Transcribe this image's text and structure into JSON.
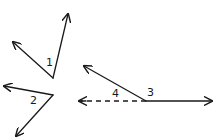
{
  "diagram": {
    "type": "angle-figures",
    "stroke_color": "#1a1a1a",
    "background": "#ffffff",
    "figures": [
      {
        "id": "angle-1",
        "label": "1",
        "vertex": [
          53,
          78
        ],
        "rays": [
          [
            68,
            14
          ],
          [
            13,
            42
          ]
        ],
        "label_pos": [
          46,
          66
        ]
      },
      {
        "id": "angle-2",
        "label": "2",
        "vertex": [
          53,
          95
        ],
        "rays": [
          [
            4,
            86
          ],
          [
            16,
            136
          ]
        ],
        "label_pos": [
          30,
          104
        ]
      },
      {
        "id": "angles-3-4",
        "labels": [
          "4",
          "3"
        ],
        "vertex": [
          146,
          101
        ],
        "rays": [
          [
            84,
            66
          ],
          [
            212,
            101
          ]
        ],
        "dashed_ray": [
          79,
          101
        ],
        "label_pos_4": [
          112,
          97
        ],
        "label_pos_3": [
          147,
          96
        ]
      }
    ]
  }
}
